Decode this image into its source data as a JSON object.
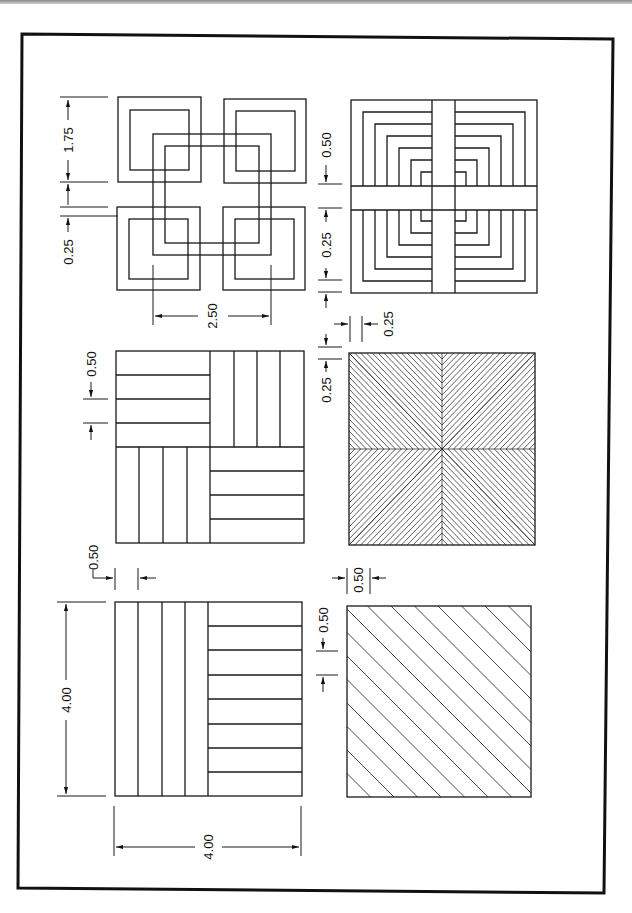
{
  "figure": {
    "orientation": "rotated-90-cw",
    "frame": {
      "x": 20,
      "y": 36,
      "width": 588,
      "height": 855,
      "stroke": "#111111"
    },
    "line_color": "#1a1a1a"
  },
  "patterns": [
    {
      "id": "interlocking-squares",
      "label": "Interlocking squares pattern"
    },
    {
      "id": "concentric-corners-cross",
      "label": "Concentric L-corners with cross pattern"
    },
    {
      "id": "parquet-quadrants",
      "label": "Parquet quadrant pattern"
    },
    {
      "id": "string-art-star",
      "label": "String art star pattern"
    },
    {
      "id": "strip-tile",
      "label": "Vertical and horizontal strip tile"
    },
    {
      "id": "diagonal-hatch",
      "label": "Diagonal hatch pattern"
    }
  ],
  "dimensions": {
    "interlock_square_size": "1.75",
    "interlock_gap": "0.25",
    "interlock_span": "2.50",
    "cross_bar_width": "0.50",
    "cross_step": "0.25",
    "cross_offset": "0.25",
    "string_art_offset": "0.25",
    "parquet_strip": "0.50",
    "parquet_offset": "0.50",
    "strip_height": "4.00",
    "strip_width": "4.00",
    "strip_spacing": "0.50",
    "hatch_spacing": "0.50",
    "hatch_offset": "0.50"
  }
}
